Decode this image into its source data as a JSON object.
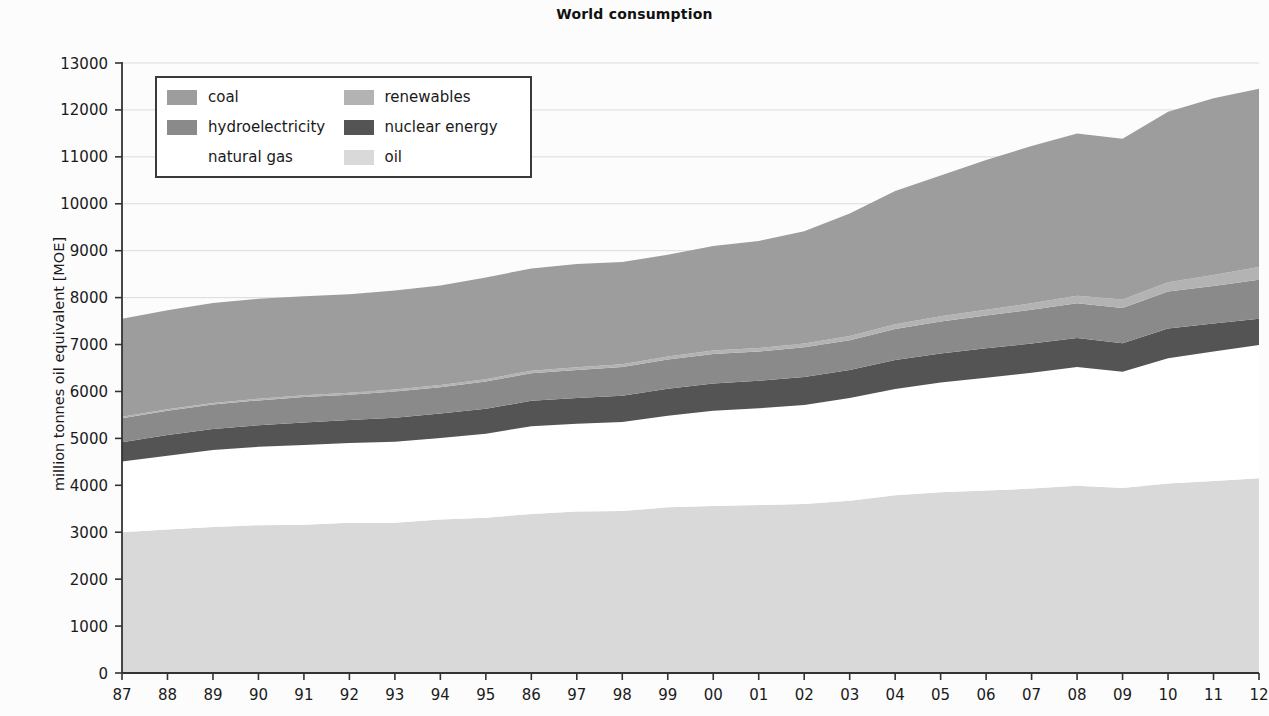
{
  "chart_data": {
    "type": "area",
    "stacked": true,
    "title": "World consumption",
    "xlabel": "",
    "ylabel": "million tonnes oil equivalent [MOE]",
    "ylim": [
      0,
      13000
    ],
    "ytick_step": 1000,
    "yticks": [
      "0",
      "1000",
      "2000",
      "3000",
      "4000",
      "5000",
      "6000",
      "7000",
      "8000",
      "9000",
      "10000",
      "11000",
      "12000",
      "13000"
    ],
    "grid": true,
    "grid_axis": "y",
    "legend_position": "upper-left-inside",
    "categories": [
      "87",
      "88",
      "89",
      "90",
      "91",
      "92",
      "93",
      "94",
      "95",
      "86",
      "97",
      "98",
      "99",
      "00",
      "01",
      "02",
      "03",
      "04",
      "05",
      "06",
      "07",
      "08",
      "09",
      "10",
      "11",
      "12"
    ],
    "stack_order_bottom_to_top": [
      "oil",
      "natural gas",
      "nuclear energy",
      "hydroelectricity",
      "renewables",
      "coal"
    ],
    "series": [
      {
        "name": "oil",
        "color": "#d9d9d9",
        "values": [
          3000,
          3060,
          3110,
          3150,
          3160,
          3200,
          3200,
          3270,
          3310,
          3390,
          3440,
          3450,
          3530,
          3560,
          3580,
          3600,
          3670,
          3790,
          3850,
          3890,
          3930,
          3990,
          3940,
          4040,
          4090,
          4150
        ]
      },
      {
        "name": "natural gas",
        "color": "#ffffff",
        "values": [
          1510,
          1570,
          1640,
          1670,
          1700,
          1700,
          1730,
          1740,
          1790,
          1870,
          1870,
          1900,
          1950,
          2030,
          2060,
          2110,
          2190,
          2260,
          2340,
          2400,
          2470,
          2530,
          2480,
          2670,
          2760,
          2840
        ]
      },
      {
        "name": "nuclear energy",
        "color": "#545454",
        "values": [
          410,
          440,
          450,
          460,
          480,
          490,
          510,
          520,
          530,
          540,
          550,
          560,
          580,
          580,
          590,
          600,
          600,
          620,
          620,
          630,
          620,
          620,
          610,
          630,
          600,
          560
        ]
      },
      {
        "name": "hydroelectricity",
        "color": "#8a8a8a",
        "values": [
          510,
          520,
          520,
          530,
          540,
          540,
          560,
          560,
          580,
          590,
          600,
          610,
          620,
          630,
          620,
          630,
          630,
          660,
          680,
          700,
          720,
          740,
          750,
          790,
          800,
          830
        ]
      },
      {
        "name": "renewables",
        "color": "#b3b3b3",
        "values": [
          30,
          32,
          34,
          36,
          38,
          40,
          43,
          46,
          49,
          53,
          57,
          61,
          66,
          71,
          77,
          83,
          91,
          100,
          111,
          124,
          140,
          159,
          178,
          200,
          230,
          270
        ]
      },
      {
        "name": "coal",
        "color": "#9d9d9d",
        "values": [
          2090,
          2110,
          2130,
          2130,
          2110,
          2100,
          2110,
          2120,
          2170,
          2180,
          2200,
          2180,
          2170,
          2230,
          2280,
          2390,
          2610,
          2840,
          3000,
          3190,
          3350,
          3460,
          3430,
          3630,
          3770,
          3800
        ]
      }
    ]
  },
  "legend": {
    "entries": [
      {
        "label": "coal",
        "color": "#9d9d9d"
      },
      {
        "label": "renewables",
        "color": "#b3b3b3"
      },
      {
        "label": "hydroelectricity",
        "color": "#8a8a8a"
      },
      {
        "label": "nuclear energy",
        "color": "#545454"
      },
      {
        "label": "natural gas",
        "color": "#ffffff"
      },
      {
        "label": "oil",
        "color": "#d9d9d9"
      }
    ]
  },
  "style": {
    "axis_color": "#333333",
    "grid_color": "#dcdcdc",
    "background": "#fcfcfc",
    "plot_background": "#ffffff"
  }
}
